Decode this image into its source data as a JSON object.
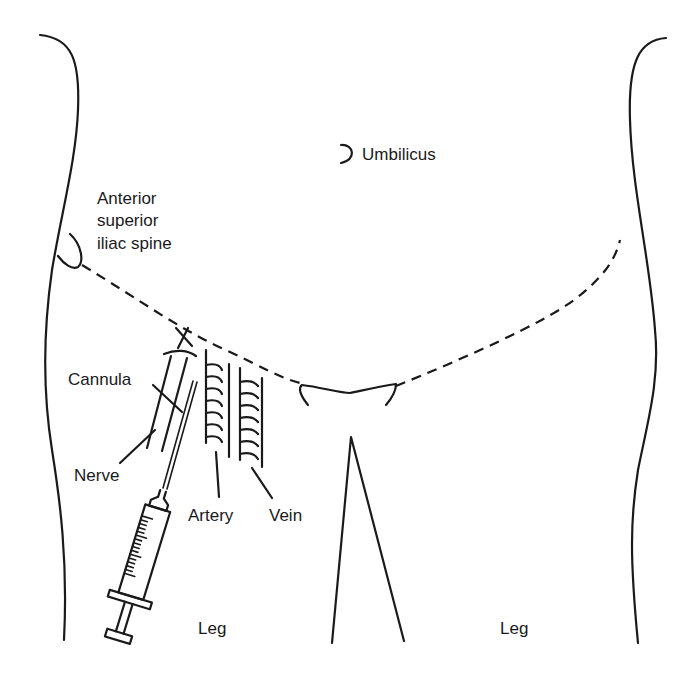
{
  "diagram": {
    "labels": {
      "umbilicus": "Umbilicus",
      "asis_line1": "Anterior",
      "asis_line2": "superior",
      "asis_line3": "iliac spine",
      "cannula": "Cannula",
      "nerve": "Nerve",
      "artery": "Artery",
      "vein": "Vein",
      "leg_left": "Leg",
      "leg_right": "Leg"
    },
    "elements": [
      "body-outline-left",
      "body-outline-right",
      "umbilicus-mark",
      "asis-mark",
      "inguinal-ligament-dashed-line",
      "pubic-symphysis",
      "thigh-separation",
      "nerve",
      "artery",
      "vein",
      "cannula-needle",
      "syringe",
      "insertion-point-x"
    ],
    "colors": {
      "ink": "#1a1a1a",
      "background": "#ffffff"
    }
  }
}
